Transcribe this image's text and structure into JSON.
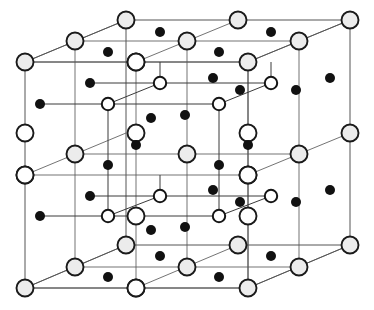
{
  "figure": {
    "title": "Crystal lattice unit cell diagram",
    "kind": "crystal-structure-unit-cell",
    "projection": "oblique",
    "background_color": "#ffffff",
    "width": 374,
    "height": 310
  },
  "style": {
    "line_color": "#3a3a3a",
    "line_width": 0.9,
    "cube_edge_color": "#555555",
    "large_circle_fill": "#ececec",
    "large_circle_stroke": "#1a1a1a",
    "large_circle_radius": 8.5,
    "large_circle_stroke_width": 1.9,
    "open_circle_fill": "#ffffff",
    "open_circle_stroke": "#1a1a1a",
    "open_circle_radius": 8.5,
    "open_circle_stroke_width": 1.9,
    "small_open_circle_fill": "#ffffff",
    "small_open_circle_stroke": "#141414",
    "small_open_circle_radius": 6.2,
    "small_open_circle_stroke_width": 2.0,
    "dot_fill": "#111111",
    "dot_radius": 5.0
  },
  "geometry": {
    "front_face": {
      "left": 25,
      "right": 248,
      "top": 62,
      "bottom": 288
    },
    "back_face": {
      "left": 126,
      "right": 350,
      "top": 20,
      "bottom": 245
    },
    "depth_offset": {
      "dx": 101,
      "dy": -42
    },
    "inner_cube_front": {
      "left": 108,
      "right": 219,
      "top": 160,
      "bottom": 216
    },
    "divisions": 2
  },
  "legend": {
    "large_sphere_label": "large shaded sphere (cation site)",
    "open_sphere_label": "open sphere (anion site)",
    "small_dot_label": "small filled dot (interstitial site)"
  },
  "chart_data": {
    "type": "scatter",
    "title": "Crystal lattice unit cell diagram",
    "xlabel": "",
    "ylabel": "",
    "xlim": [
      0,
      374
    ],
    "ylim": [
      0,
      310
    ],
    "grid": false,
    "legend_position": "none",
    "series": [
      {
        "name": "cube-edges",
        "kind": "segments",
        "stroke": "#555555",
        "values": [
          [
            25,
            62,
            248,
            62
          ],
          [
            248,
            62,
            248,
            288
          ],
          [
            248,
            288,
            25,
            288
          ],
          [
            25,
            288,
            25,
            62
          ],
          [
            126,
            20,
            350,
            20
          ],
          [
            350,
            20,
            350,
            245
          ],
          [
            350,
            245,
            126,
            245
          ],
          [
            126,
            245,
            126,
            20
          ],
          [
            25,
            62,
            126,
            20
          ],
          [
            248,
            62,
            350,
            20
          ],
          [
            248,
            288,
            350,
            245
          ],
          [
            25,
            288,
            126,
            245
          ]
        ]
      },
      {
        "name": "internal-grid-lines",
        "kind": "segments",
        "stroke": "#5a5a5a",
        "values": [
          [
            75,
            41,
            75,
            267
          ],
          [
            136,
            62,
            136,
            288
          ],
          [
            187,
            41,
            187,
            267
          ],
          [
            248,
            62,
            248,
            288
          ],
          [
            299,
            41,
            299,
            267
          ],
          [
            75,
            41,
            299,
            41
          ],
          [
            25,
            62,
            248,
            62
          ],
          [
            75,
            154,
            299,
            154
          ],
          [
            25,
            175,
            248,
            175
          ],
          [
            75,
            267,
            299,
            267
          ],
          [
            25,
            288,
            248,
            288
          ],
          [
            25,
            62,
            126,
            20
          ],
          [
            25,
            175,
            126,
            133
          ],
          [
            25,
            288,
            126,
            245
          ],
          [
            136,
            62,
            238,
            20
          ],
          [
            136,
            288,
            238,
            245
          ],
          [
            248,
            62,
            350,
            20
          ],
          [
            248,
            175,
            350,
            133
          ],
          [
            248,
            288,
            350,
            245
          ]
        ]
      },
      {
        "name": "inner-bond-lines-upper",
        "kind": "segments",
        "stroke": "#3a3a3a",
        "values": [
          [
            40,
            104,
            219,
            104
          ],
          [
            90,
            83,
            270,
            83
          ],
          [
            108,
            104,
            160,
            83
          ],
          [
            219,
            104,
            271,
            83
          ],
          [
            108,
            104,
            108,
            160
          ],
          [
            219,
            104,
            219,
            160
          ],
          [
            160,
            83,
            160,
            62
          ],
          [
            271,
            83,
            271,
            62
          ]
        ]
      },
      {
        "name": "inner-bond-lines-lower",
        "kind": "segments",
        "stroke": "#3a3a3a",
        "values": [
          [
            40,
            216,
            219,
            216
          ],
          [
            90,
            196,
            270,
            196
          ],
          [
            108,
            216,
            160,
            196
          ],
          [
            219,
            216,
            271,
            196
          ],
          [
            108,
            160,
            108,
            216
          ],
          [
            219,
            160,
            219,
            216
          ],
          [
            160,
            196,
            160,
            175
          ]
        ]
      },
      {
        "name": "large-shaded-spheres",
        "kind": "points",
        "marker": "large-shaded-circle",
        "fill": "#ececec",
        "stroke": "#1a1a1a",
        "values": [
          [
            25,
            62
          ],
          [
            136,
            62
          ],
          [
            248,
            62
          ],
          [
            25,
            175
          ],
          [
            248,
            175
          ],
          [
            25,
            288
          ],
          [
            136,
            288
          ],
          [
            248,
            288
          ],
          [
            126,
            20
          ],
          [
            238,
            20
          ],
          [
            350,
            20
          ],
          [
            350,
            133
          ],
          [
            126,
            245
          ],
          [
            238,
            245
          ],
          [
            350,
            245
          ],
          [
            75,
            41
          ],
          [
            187,
            41
          ],
          [
            299,
            41
          ],
          [
            75,
            154
          ],
          [
            187,
            154
          ],
          [
            299,
            154
          ],
          [
            75,
            267
          ],
          [
            187,
            267
          ],
          [
            299,
            267
          ]
        ]
      },
      {
        "name": "open-spheres",
        "kind": "points",
        "marker": "open-circle",
        "fill": "#ffffff",
        "stroke": "#1a1a1a",
        "values": [
          [
            136,
            62
          ],
          [
            25,
            175
          ],
          [
            248,
            175
          ],
          [
            136,
            288
          ],
          [
            136,
            133
          ],
          [
            248,
            133
          ],
          [
            25,
            133
          ],
          [
            136,
            216
          ],
          [
            248,
            216
          ]
        ]
      },
      {
        "name": "small-open-circles",
        "kind": "points",
        "marker": "small-open-circle",
        "fill": "#ffffff",
        "stroke": "#141414",
        "values": [
          [
            108,
            104
          ],
          [
            219,
            104
          ],
          [
            160,
            83
          ],
          [
            271,
            83
          ],
          [
            108,
            216
          ],
          [
            219,
            216
          ],
          [
            160,
            196
          ],
          [
            271,
            196
          ]
        ]
      },
      {
        "name": "filled-dots",
        "kind": "points",
        "marker": "filled-dot",
        "fill": "#111111",
        "values": [
          [
            160,
            32
          ],
          [
            271,
            32
          ],
          [
            108,
            52
          ],
          [
            219,
            52
          ],
          [
            40,
            104
          ],
          [
            90,
            83
          ],
          [
            185,
            115
          ],
          [
            151,
            118
          ],
          [
            213,
            78
          ],
          [
            240,
            90
          ],
          [
            330,
            78
          ],
          [
            296,
            90
          ],
          [
            136,
            145
          ],
          [
            248,
            145
          ],
          [
            108,
            165
          ],
          [
            219,
            165
          ],
          [
            40,
            216
          ],
          [
            90,
            196
          ],
          [
            185,
            227
          ],
          [
            151,
            230
          ],
          [
            213,
            190
          ],
          [
            240,
            202
          ],
          [
            330,
            190
          ],
          [
            296,
            202
          ],
          [
            160,
            256
          ],
          [
            271,
            256
          ],
          [
            108,
            277
          ],
          [
            219,
            277
          ],
          [
            108,
            104
          ],
          [
            219,
            104
          ]
        ]
      }
    ]
  }
}
